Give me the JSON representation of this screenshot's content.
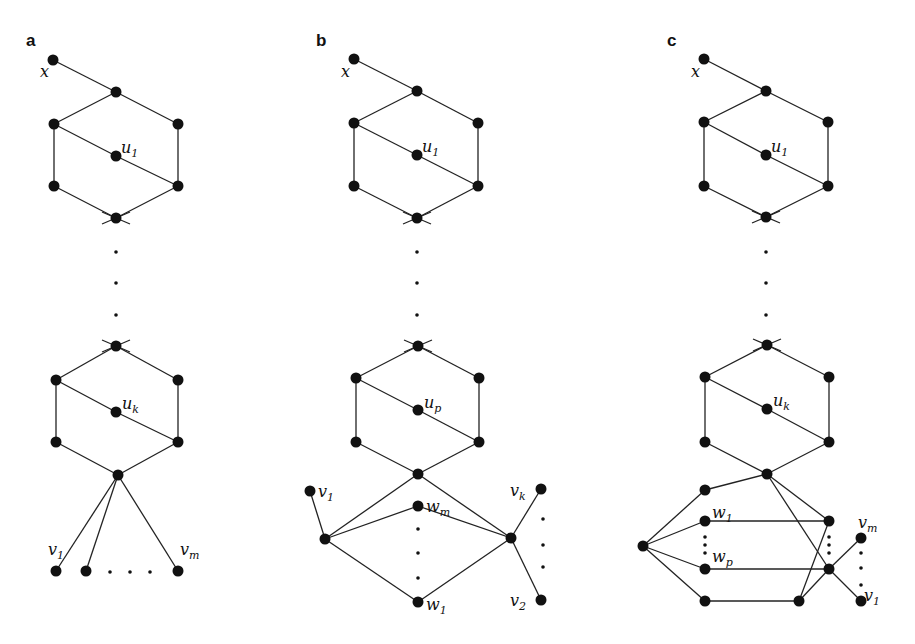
{
  "panels": [
    {
      "id": "a",
      "label": "a",
      "label_pos": [
        26,
        46
      ],
      "nodes": {
        "x": [
          53,
          60
        ],
        "t1": [
          116,
          92
        ],
        "l1": [
          54,
          124
        ],
        "r1": [
          178,
          124
        ],
        "u1": [
          116,
          156
        ],
        "bl1": [
          54,
          186
        ],
        "br1": [
          178,
          186
        ],
        "b1": [
          116,
          218
        ],
        "t2": [
          116,
          346
        ],
        "l2": [
          56,
          380
        ],
        "r2": [
          178,
          380
        ],
        "u2": [
          116,
          412
        ],
        "bl2": [
          56,
          442
        ],
        "br2": [
          178,
          442
        ],
        "hub": [
          118,
          475
        ],
        "v1": [
          56,
          571
        ],
        "v2": [
          86,
          571
        ],
        "vm": [
          178,
          571
        ]
      },
      "edges": [
        [
          "x",
          "t1"
        ],
        [
          "t1",
          "l1"
        ],
        [
          "t1",
          "r1"
        ],
        [
          "l1",
          "u1"
        ],
        [
          "u1",
          "br1"
        ],
        [
          "l1",
          "bl1"
        ],
        [
          "r1",
          "br1"
        ],
        [
          "bl1",
          "b1"
        ],
        [
          "br1",
          "b1"
        ],
        [
          "t2",
          "l2"
        ],
        [
          "t2",
          "r2"
        ],
        [
          "l2",
          "u2"
        ],
        [
          "u2",
          "br2"
        ],
        [
          "l2",
          "bl2"
        ],
        [
          "r2",
          "br2"
        ],
        [
          "bl2",
          "hub"
        ],
        [
          "br2",
          "hub"
        ],
        [
          "hub",
          "v1"
        ],
        [
          "hub",
          "v2"
        ],
        [
          "hub",
          "vm"
        ]
      ],
      "crosses": [
        [
          116,
          218,
          "down"
        ],
        [
          116,
          346,
          "up"
        ]
      ],
      "dots": [
        [
          116,
          252
        ],
        [
          116,
          283
        ],
        [
          116,
          315
        ],
        [
          110,
          572
        ],
        [
          130,
          572
        ],
        [
          150,
          572
        ]
      ],
      "labels": [
        {
          "text": "x",
          "sub": "",
          "pos": [
            40,
            77
          ]
        },
        {
          "text": "u",
          "sub": "1",
          "pos": [
            121,
            153
          ]
        },
        {
          "text": "u",
          "sub": "k",
          "pos": [
            122,
            409
          ]
        },
        {
          "text": "v",
          "sub": "1",
          "pos": [
            48,
            555
          ]
        },
        {
          "text": "v",
          "sub": "m",
          "pos": [
            180,
            555
          ]
        }
      ]
    },
    {
      "id": "b",
      "label": "b",
      "label_pos": [
        316,
        46
      ],
      "nodes": {
        "x": [
          354,
          59
        ],
        "t1": [
          417,
          91
        ],
        "l1": [
          354,
          123
        ],
        "r1": [
          478,
          123
        ],
        "u1": [
          417,
          155
        ],
        "bl1": [
          354,
          186
        ],
        "br1": [
          478,
          186
        ],
        "b1": [
          417,
          218
        ],
        "t2": [
          418,
          346
        ],
        "l2": [
          356,
          378
        ],
        "r2": [
          479,
          378
        ],
        "u2": [
          418,
          410
        ],
        "bl2": [
          356,
          442
        ],
        "br2": [
          479,
          442
        ],
        "hub": [
          418,
          474
        ],
        "v1": [
          310,
          491
        ],
        "L": [
          325,
          539
        ],
        "wm": [
          418,
          506
        ],
        "R": [
          511,
          538
        ],
        "vk": [
          541,
          489
        ],
        "w1": [
          418,
          602
        ],
        "v2": [
          541,
          600
        ]
      },
      "edges": [
        [
          "x",
          "t1"
        ],
        [
          "t1",
          "l1"
        ],
        [
          "t1",
          "r1"
        ],
        [
          "l1",
          "u1"
        ],
        [
          "u1",
          "br1"
        ],
        [
          "l1",
          "bl1"
        ],
        [
          "r1",
          "br1"
        ],
        [
          "bl1",
          "b1"
        ],
        [
          "br1",
          "b1"
        ],
        [
          "t2",
          "l2"
        ],
        [
          "t2",
          "r2"
        ],
        [
          "l2",
          "u2"
        ],
        [
          "u2",
          "br2"
        ],
        [
          "l2",
          "bl2"
        ],
        [
          "r2",
          "br2"
        ],
        [
          "bl2",
          "hub"
        ],
        [
          "br2",
          "hub"
        ],
        [
          "hub",
          "L"
        ],
        [
          "hub",
          "R"
        ],
        [
          "v1",
          "L"
        ],
        [
          "L",
          "wm"
        ],
        [
          "wm",
          "R"
        ],
        [
          "L",
          "w1"
        ],
        [
          "w1",
          "R"
        ],
        [
          "R",
          "vk"
        ],
        [
          "R",
          "v2"
        ]
      ],
      "crosses": [
        [
          417,
          218,
          "down"
        ],
        [
          418,
          346,
          "up"
        ]
      ],
      "dots": [
        [
          417,
          252
        ],
        [
          417,
          283
        ],
        [
          417,
          315
        ],
        [
          418,
          529
        ],
        [
          418,
          553
        ],
        [
          418,
          578
        ],
        [
          543,
          519
        ],
        [
          543,
          545
        ],
        [
          543,
          567
        ]
      ],
      "labels": [
        {
          "text": "x",
          "sub": "",
          "pos": [
            341,
            77
          ]
        },
        {
          "text": "u",
          "sub": "1",
          "pos": [
            422,
            152
          ]
        },
        {
          "text": "u",
          "sub": "p",
          "pos": [
            424,
            408
          ]
        },
        {
          "text": "v",
          "sub": "1",
          "pos": [
            318,
            497
          ]
        },
        {
          "text": "w",
          "sub": "m",
          "pos": [
            426,
            512
          ]
        },
        {
          "text": "v",
          "sub": "k",
          "pos": [
            510,
            496
          ]
        },
        {
          "text": "w",
          "sub": "1",
          "pos": [
            426,
            610
          ]
        },
        {
          "text": "v",
          "sub": "2",
          "pos": [
            510,
            606
          ]
        }
      ]
    },
    {
      "id": "c",
      "label": "c",
      "label_pos": [
        667,
        46
      ],
      "nodes": {
        "x": [
          704,
          59
        ],
        "t1": [
          766,
          91
        ],
        "l1": [
          704,
          122
        ],
        "r1": [
          828,
          122
        ],
        "u1": [
          766,
          155
        ],
        "bl1": [
          704,
          186
        ],
        "br1": [
          828,
          186
        ],
        "b1": [
          766,
          217
        ],
        "t2": [
          767,
          345
        ],
        "l2": [
          705,
          377
        ],
        "r2": [
          829,
          377
        ],
        "u2": [
          767,
          409
        ],
        "bl2": [
          705,
          442
        ],
        "br2": [
          829,
          442
        ],
        "hub": [
          767,
          474
        ],
        "a": [
          705,
          490
        ],
        "w1": [
          705,
          521
        ],
        "L": [
          643,
          546
        ],
        "wp": [
          705,
          569
        ],
        "bot": [
          705,
          601
        ],
        "R1": [
          829,
          521
        ],
        "R2": [
          829,
          569
        ],
        "botR": [
          799,
          601
        ],
        "vm": [
          861,
          538
        ],
        "v1": [
          861,
          601
        ]
      },
      "edges": [
        [
          "x",
          "t1"
        ],
        [
          "t1",
          "l1"
        ],
        [
          "t1",
          "r1"
        ],
        [
          "l1",
          "u1"
        ],
        [
          "u1",
          "br1"
        ],
        [
          "l1",
          "bl1"
        ],
        [
          "r1",
          "br1"
        ],
        [
          "bl1",
          "b1"
        ],
        [
          "br1",
          "b1"
        ],
        [
          "t2",
          "l2"
        ],
        [
          "t2",
          "r2"
        ],
        [
          "l2",
          "u2"
        ],
        [
          "u2",
          "br2"
        ],
        [
          "l2",
          "bl2"
        ],
        [
          "r2",
          "br2"
        ],
        [
          "bl2",
          "hub"
        ],
        [
          "br2",
          "hub"
        ],
        [
          "hub",
          "a"
        ],
        [
          "a",
          "L"
        ],
        [
          "L",
          "w1"
        ],
        [
          "L",
          "wp"
        ],
        [
          "L",
          "bot"
        ],
        [
          "w1",
          "R1"
        ],
        [
          "wp",
          "R2"
        ],
        [
          "bot",
          "botR"
        ],
        [
          "hub",
          "R1"
        ],
        [
          "hub",
          "R2"
        ],
        [
          "R2",
          "v1"
        ],
        [
          "botR",
          "R1"
        ],
        [
          "botR",
          "R2"
        ],
        [
          "R2",
          "vm"
        ]
      ],
      "crosses": [
        [
          766,
          217,
          "down"
        ],
        [
          767,
          345,
          "up"
        ]
      ],
      "dots": [
        [
          766,
          252
        ],
        [
          766,
          283
        ],
        [
          766,
          315
        ],
        [
          705,
          537
        ],
        [
          705,
          545
        ],
        [
          705,
          553
        ],
        [
          829,
          537
        ],
        [
          829,
          545
        ],
        [
          829,
          553
        ],
        [
          861,
          553
        ],
        [
          861,
          568
        ],
        [
          861,
          585
        ]
      ],
      "labels": [
        {
          "text": "x",
          "sub": "",
          "pos": [
            691,
            77
          ]
        },
        {
          "text": "u",
          "sub": "1",
          "pos": [
            771,
            152
          ]
        },
        {
          "text": "u",
          "sub": "k",
          "pos": [
            773,
            406
          ]
        },
        {
          "text": "w",
          "sub": "1",
          "pos": [
            712,
            518
          ]
        },
        {
          "text": "w",
          "sub": "p",
          "pos": [
            712,
            562
          ]
        },
        {
          "text": "v",
          "sub": "m",
          "pos": [
            858,
            528
          ]
        },
        {
          "text": "v",
          "sub": "1",
          "pos": [
            864,
            601
          ]
        }
      ]
    }
  ]
}
